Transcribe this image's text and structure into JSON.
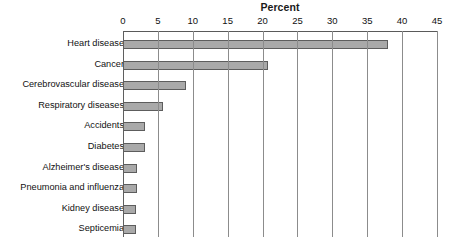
{
  "chart_data": {
    "type": "bar",
    "orientation": "horizontal",
    "title": "Percent",
    "xlabel": "Percent",
    "ylabel": "",
    "xlim": [
      0,
      45
    ],
    "xticks": [
      0,
      5,
      10,
      15,
      20,
      25,
      30,
      35,
      40,
      45
    ],
    "grid": true,
    "legend": false,
    "bar_color": "#a9a9a9",
    "bar_border_color": "#5d5d5d",
    "categories": [
      "Heart disease",
      "Cancer",
      "Cerebrovascular disease",
      "Respiratory diseases",
      "Accidents",
      "Diabetes",
      "Alzheimer's disease",
      "Pneumonia and influenza",
      "Kidney disease",
      "Septicemia"
    ],
    "values": [
      38.0,
      20.8,
      9.0,
      5.7,
      3.2,
      3.1,
      2.0,
      2.0,
      1.9,
      1.8
    ]
  }
}
